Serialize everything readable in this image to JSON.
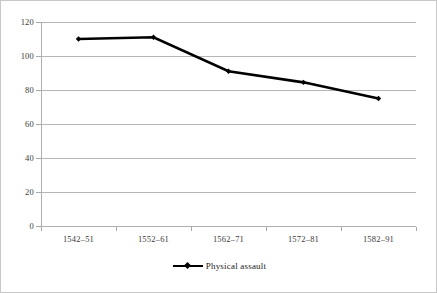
{
  "chart_data": {
    "type": "line",
    "title": "",
    "subtitle": "",
    "xlabel": "",
    "ylabel": "",
    "categories": [
      "1542–51",
      "1552–61",
      "1562–71",
      "1572–81",
      "1582–91"
    ],
    "series": [
      {
        "name": "Physical assault",
        "values": [
          110,
          111,
          91,
          84.5,
          75
        ],
        "color": "#000000",
        "marker": "diamond"
      }
    ],
    "ylim": [
      0,
      120
    ],
    "yticks": [
      0,
      20,
      40,
      60,
      80,
      100,
      120
    ],
    "ytick_labels": [
      "0",
      "20",
      "40",
      "60",
      "80",
      "100",
      "120"
    ],
    "grid": true,
    "grid_axis": "y",
    "legend_position": "bottom",
    "legend_entries": [
      "Physical assault"
    ],
    "annotations": []
  },
  "legend": {
    "label": "Physical assault",
    "marker_name": "line-diamond-marker"
  },
  "colors": {
    "series": "#000000",
    "gridline": "#b6b6b6",
    "axis": "#b0b0b0",
    "text": "#3a3a3a",
    "background": "#ffffff",
    "border": "#c8c8c8"
  }
}
